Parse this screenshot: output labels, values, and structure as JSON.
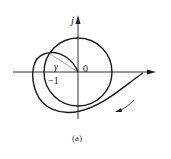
{
  "figure": {
    "caption": "(a)",
    "labels": {
      "imag_axis": "j",
      "origin": "0",
      "critical_point": "−1",
      "angle": "γ"
    },
    "colors": {
      "stroke": "#1a1a1a",
      "radial_line": "#888888",
      "background": "#ffffff"
    },
    "elements": {
      "real_axis": "horizontal axis with arrow to the right",
      "imag_axis": "vertical axis with arrow upward",
      "unit_circle": "circle of radius 1 centered at origin",
      "nyquist_curve": "curve starting on positive real axis, sweeping clockwise below, looping left around −1 and ending at origin",
      "radial_line": "line from origin to intersection of curve with unit circle, defining phase margin angle γ",
      "direction_arrow": "arrow indicating direction of traversal along curve (down-left)"
    }
  }
}
